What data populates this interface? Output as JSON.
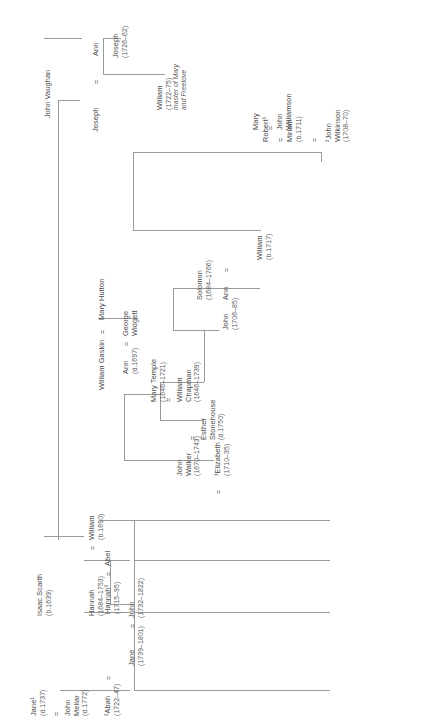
{
  "diagram": {
    "type": "genealogical-family-tree",
    "orientation": "rotated-90-ccw",
    "marriage_symbol": "=",
    "line_color": "#9a9a9a",
    "text_color": "#4a4a4a"
  },
  "people": {
    "john_vaughan": {
      "name": "John Vaughan",
      "dates": ""
    },
    "ann_vaughan": {
      "name": "Ann",
      "dates": ""
    },
    "joseph_sr": {
      "name": "Joseph",
      "dates": ""
    },
    "joseph_jr": {
      "name": "Joseph",
      "dates": "(1726–62)"
    },
    "william_1722": {
      "name": "William",
      "dates": "(1722–75)",
      "note1": "master of Mary",
      "note2": "and Freelove"
    },
    "john_wilkinson": {
      "name": "²John",
      "surname": "Wilkinson",
      "dates": "(1708–70)"
    },
    "miriam": {
      "name": "Miriam",
      "dates": "(b.1711)"
    },
    "robert": {
      "name": "Robert¹",
      "dates": ""
    },
    "mary_williamson": {
      "name": "Mary",
      "dates": ""
    },
    "john_williamson": {
      "name": "John",
      "surname": "Williamson",
      "dates": ""
    },
    "william_b1717": {
      "name": "William",
      "dates": "(b.1717)"
    },
    "john_1706": {
      "name": "John",
      "dates": "(1706–85)"
    },
    "ann_solomon": {
      "name": "Ann",
      "dates": ""
    },
    "solomon": {
      "name": "Solomon",
      "dates": "(1684–1766)"
    },
    "william_gaskin": {
      "name": "William Gaskin",
      "dates": ""
    },
    "mary_hutton": {
      "name": "Mary Hutton",
      "dates": ""
    },
    "ann_widgett": {
      "name": "Ann",
      "dates": "(d.1697)"
    },
    "george_widgett": {
      "name": "George",
      "surname": "Widgett",
      "dates": ""
    },
    "mary_temple": {
      "name": "Mary Temple",
      "dates": "(1646–1721)"
    },
    "william_chapman": {
      "name": "William",
      "surname": "Chapman",
      "dates": "(1646–1739)"
    },
    "esther_stonehouse": {
      "name": "Esther",
      "surname": "Stonehouse",
      "dates": "(d.1750)"
    },
    "john_walker": {
      "name": "John",
      "surname": "Walker",
      "dates": "(1670–1743)"
    },
    "elizabeth": {
      "name": "¹Elizabeth",
      "dates": "(1710–35)"
    },
    "isaac_scarth": {
      "name": "Isaac Scarth",
      "dates": "(b.1639)"
    },
    "hannah_1684": {
      "name": "Hannah",
      "dates": "(1684–1753)"
    },
    "william_b1690": {
      "name": "William",
      "dates": "(b.1690)"
    },
    "hannah_1715": {
      "name": "Hannah³",
      "dates": "(1715–95)"
    },
    "abel": {
      "name": "Abel",
      "dates": ""
    },
    "jane_1739": {
      "name": "Jane",
      "dates": "(1739–1801)"
    },
    "john_1732": {
      "name": "John",
      "dates": "(1732–1822)"
    },
    "john_mellar": {
      "name": "John",
      "surname": "Mellar",
      "dates": "(d.1772)"
    },
    "jane_d1737": {
      "name": "Jane¹",
      "dates": "(d.1737)"
    },
    "abah": {
      "name": "²Abah",
      "dates": "(1722–47)"
    }
  }
}
